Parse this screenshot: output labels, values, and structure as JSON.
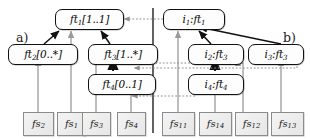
{
  "figure": {
    "panels": [
      {
        "id": "a",
        "label": "a)"
      },
      {
        "id": "b",
        "label": "b)"
      }
    ],
    "divider": "vertical-panel-divider"
  },
  "panel_a": {
    "label": "a)",
    "nodes": [
      {
        "id": "ft1",
        "name": "ft",
        "index": "1",
        "multiplicity": "[1..1]"
      },
      {
        "id": "ft2",
        "name": "ft",
        "index": "2",
        "multiplicity": "[0..*]"
      },
      {
        "id": "ft3",
        "name": "ft",
        "index": "3",
        "multiplicity": "[1..*]"
      },
      {
        "id": "ft4",
        "name": "ft",
        "index": "4",
        "multiplicity": "[0..1]"
      }
    ],
    "sources": [
      {
        "id": "fs2",
        "name": "fs",
        "index": "2"
      },
      {
        "id": "fs1",
        "name": "fs",
        "index": "1"
      },
      {
        "id": "fs3",
        "name": "fs",
        "index": "3"
      },
      {
        "id": "fs4",
        "name": "fs",
        "index": "4"
      }
    ]
  },
  "panel_b": {
    "label": "b)",
    "nodes": [
      {
        "id": "i1",
        "instance": "i",
        "index": "1",
        "type": "ft",
        "type_index": "1"
      },
      {
        "id": "i2",
        "instance": "i",
        "index": "2",
        "type": "ft",
        "type_index": "3"
      },
      {
        "id": "i3",
        "instance": "i",
        "index": "3",
        "type": "ft",
        "type_index": "3"
      },
      {
        "id": "i4",
        "instance": "i",
        "index": "4",
        "type": "ft",
        "type_index": "4"
      }
    ],
    "sources": [
      {
        "id": "fs11",
        "name": "fs",
        "index": "11"
      },
      {
        "id": "fs14",
        "name": "fs",
        "index": "14"
      },
      {
        "id": "fs12",
        "name": "fs",
        "index": "12"
      },
      {
        "id": "fs13",
        "name": "fs",
        "index": "13"
      }
    ]
  },
  "colors": {
    "node_border": "#111111",
    "node_fill": "#fdfdfd",
    "source_border": "#8b8b8b",
    "source_fill": "#ececec",
    "solid_edge": "#111111",
    "gray_edge": "#9a9a9a",
    "dotted_edge": "#9a9a9a",
    "divider": "#3a3a3a"
  }
}
